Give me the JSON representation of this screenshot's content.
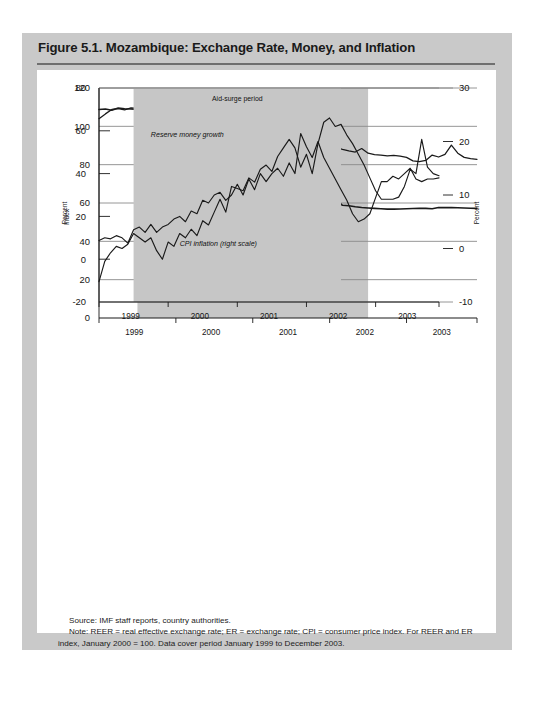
{
  "figure": {
    "title": "Figure 5.1. Mozambique: Exchange Rate, Money, and Inflation",
    "source": "Source: IMF staff reports, country authorities.",
    "note": "Note: REER = real effective exchange rate; ER = exchange rate; CPI = consumer price index. For REER and ER index, January 2000 = 100. Data cover period January 1999 to December 2003."
  },
  "colors": {
    "frame_gray": "#c9c9c9",
    "panel_white": "#ffffff",
    "shade_gray": "#c6c6c6",
    "line_black": "#1a1a1a",
    "grid_gray": "#8a8a8a",
    "rule_gray": "#6f6f6f"
  },
  "chart_data": [
    {
      "type": "line",
      "id": "top-panel",
      "title": "",
      "xlabel": "",
      "ylabel": "Index",
      "ylim": [
        0,
        120
      ],
      "yticks": [
        0,
        20,
        40,
        60,
        80,
        100,
        120
      ],
      "ytick_labels": [
        "0",
        "20",
        "40",
        "60",
        "80",
        "100",
        "120"
      ],
      "grid": true,
      "legend": "inline-annotations",
      "xlim": [
        "1999-01",
        "2003-12"
      ],
      "xtick_labels": [
        "1999",
        "2000",
        "2001",
        "2002",
        "2003"
      ],
      "annotations": [
        {
          "text": "Aid-surge period",
          "italic": false
        },
        {
          "text": "REER index",
          "italic": true
        },
        {
          "text": "ER index",
          "italic": true
        }
      ],
      "shaded_region": {
        "label": "Aid-surge period",
        "start": "1999-07",
        "end": "2002-07"
      },
      "series": [
        {
          "name": "REER index",
          "values": [
            104.0,
            106.5,
            108.8,
            109.2,
            108.6,
            109.6,
            109.4,
            108.6,
            108.8,
            108.2,
            107.0,
            105.4,
            103.4,
            101.2,
            99.6,
            98.8,
            100.1,
            100.0,
            102.6,
            104.6,
            104.2,
            105.6,
            103.2,
            105.8,
            103.8,
            103.2,
            103.4,
            104.0,
            104.6,
            105.2,
            106.0,
            104.0,
            102.0,
            100.0,
            97.0,
            94.0,
            91.0,
            89.0,
            88.0,
            87.2,
            86.6,
            88.4,
            86.0,
            85.2,
            85.0,
            84.6,
            84.8,
            84.4,
            83.8,
            82.0,
            81.6,
            82.2,
            85.0,
            84.0,
            85.4,
            90.2,
            86.0,
            83.8,
            83.2,
            82.8
          ]
        },
        {
          "name": "ER index",
          "values": [
            108.8,
            109.0,
            108.4,
            109.6,
            109.2,
            109.0,
            108.8,
            108.0,
            107.0,
            105.4,
            103.6,
            101.6,
            100.0,
            100.8,
            99.4,
            101.0,
            100.2,
            99.4,
            96.0,
            93.4,
            90.6,
            88.6,
            88.0,
            87.8,
            87.6,
            87.0,
            86.0,
            84.6,
            82.0,
            80.6,
            80.2,
            77.0,
            73.2,
            70.0,
            67.0,
            63.4,
            62.6,
            61.8,
            58.8,
            58.6,
            58.0,
            57.6,
            57.4,
            57.2,
            57.0,
            56.8,
            56.8,
            56.9,
            57.0,
            57.1,
            57.2,
            57.2,
            57.0,
            57.6,
            57.6,
            57.6,
            57.5,
            57.4,
            57.3,
            57.2
          ]
        }
      ]
    },
    {
      "type": "line",
      "id": "bottom-panel",
      "title": "",
      "xlabel": "",
      "ylabel": "Percent",
      "ylabel_right": "Percent",
      "ylim": [
        -20,
        80
      ],
      "yticks": [
        -20,
        0,
        20,
        40,
        60,
        80
      ],
      "ytick_labels": [
        "-20",
        "0",
        "20",
        "40",
        "60",
        "80"
      ],
      "ylim_right": [
        -10,
        30
      ],
      "yticks_right": [
        -10,
        0,
        10,
        20,
        30
      ],
      "ytick_labels_right": [
        "-10",
        "0",
        "10",
        "20",
        "30"
      ],
      "grid": true,
      "xlim": [
        "1999-01",
        "2003-12"
      ],
      "xtick_labels": [
        "1999",
        "2000",
        "2001",
        "2002",
        "2003"
      ],
      "annotations": [
        {
          "text": "Aid-surge period",
          "italic": false
        },
        {
          "text": "Reserve money growth",
          "italic": true
        },
        {
          "text": "CPI inflation (right scale)",
          "italic": true
        }
      ],
      "shaded_region": {
        "label": "Aid-surge period",
        "start": "1999-07",
        "end": "2002-07"
      },
      "series": [
        {
          "name": "Reserve money growth",
          "scale": "left",
          "values": [
            -10.5,
            -1.0,
            3.0,
            6.0,
            5.0,
            7.0,
            12.0,
            10.0,
            8.0,
            10.0,
            4.0,
            0.0,
            8.0,
            6.0,
            12.0,
            10.0,
            14.0,
            11.0,
            18.0,
            16.0,
            22.0,
            28.0,
            22.0,
            34.0,
            33.0,
            32.0,
            38.0,
            36.0,
            42.0,
            44.0,
            41.0,
            48.0,
            52.0,
            56.0,
            52.0,
            43.0,
            49.0,
            40.0,
            54.0,
            64.0,
            66.0,
            62.0,
            63.0,
            58.0,
            54.0,
            49.0,
            44.0,
            38.0,
            32.0,
            28.0,
            28.0,
            28.0,
            29.0,
            34.0,
            42.0,
            40.0,
            56.0,
            43.0,
            40.0,
            39.0
          ]
        },
        {
          "name": "CPI inflation (right scale)",
          "scale": "right",
          "values": [
            1.5,
            2.0,
            1.8,
            2.4,
            2.0,
            1.0,
            3.5,
            4.0,
            3.0,
            4.5,
            3.0,
            4.0,
            4.5,
            5.5,
            6.0,
            5.0,
            7.0,
            6.5,
            9.0,
            8.5,
            10.0,
            10.5,
            9.0,
            10.0,
            12.0,
            10.0,
            13.0,
            11.0,
            14.0,
            12.5,
            14.0,
            15.0,
            13.5,
            16.0,
            14.0,
            21.5,
            19.0,
            17.0,
            20.0,
            17.0,
            15.0,
            13.0,
            11.0,
            9.0,
            6.5,
            5.0,
            5.5,
            6.5,
            9.5,
            12.5,
            12.5,
            13.5,
            13.0,
            14.0,
            15.0,
            13.0,
            12.5,
            13.0,
            13.0,
            13.2
          ]
        }
      ]
    }
  ]
}
